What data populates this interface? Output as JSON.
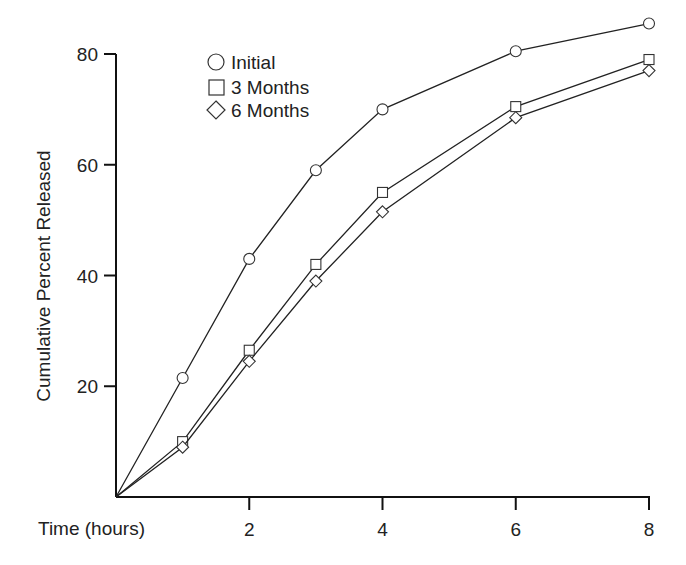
{
  "chart_data": {
    "type": "line",
    "title": "",
    "xlabel": "Time (hours)",
    "ylabel": "Cumulative Percent Released",
    "x": [
      0,
      1,
      2,
      3,
      4,
      6,
      8
    ],
    "x_ticks": [
      2,
      4,
      6,
      8
    ],
    "y_ticks": [
      20,
      40,
      60,
      80
    ],
    "xlim": [
      0,
      8
    ],
    "ylim": [
      0,
      80
    ],
    "grid": false,
    "legend_position": "upper-left-inside",
    "series": [
      {
        "name": "Initial",
        "marker": "circle",
        "values": [
          0,
          21.5,
          43,
          59,
          70,
          80.5,
          85.5
        ]
      },
      {
        "name": "3 Months",
        "marker": "square",
        "values": [
          0,
          10,
          26.5,
          42,
          55,
          70.5,
          79
        ]
      },
      {
        "name": "6 Months",
        "marker": "diamond",
        "values": [
          0,
          9,
          24.5,
          39,
          51.5,
          68.5,
          77
        ]
      }
    ]
  },
  "legend": {
    "items": [
      {
        "label": "Initial",
        "marker": "circle"
      },
      {
        "label": "3 Months",
        "marker": "square"
      },
      {
        "label": "6 Months",
        "marker": "diamond"
      }
    ]
  },
  "axes": {
    "x_title": "Time (hours)",
    "y_title": "Cumulative Percent Released",
    "x_tick_labels": [
      "2",
      "4",
      "6",
      "8"
    ],
    "y_tick_labels": [
      "20",
      "40",
      "60",
      "80"
    ]
  },
  "style": {
    "line_color": "#222222",
    "marker_fill": "#ffffff",
    "background": "#ffffff"
  }
}
